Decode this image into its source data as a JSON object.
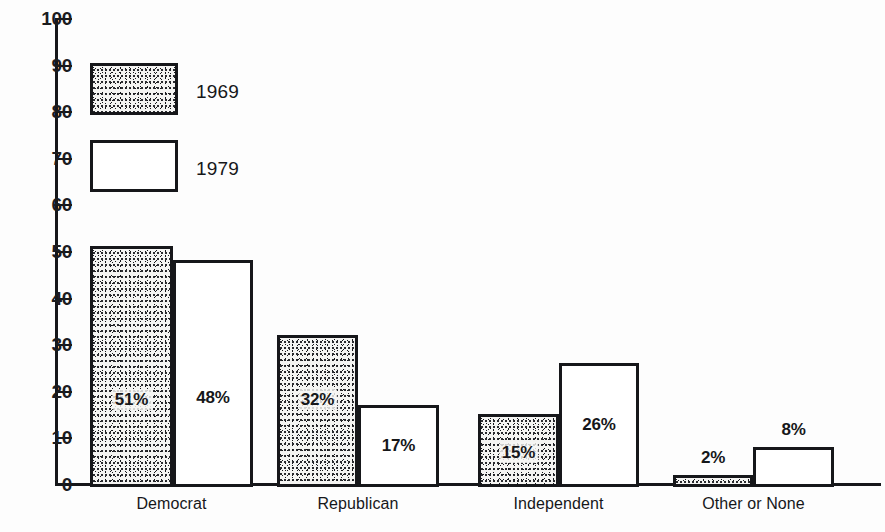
{
  "chart_data": {
    "type": "bar",
    "title": "",
    "subtitle": "",
    "xlabel": "",
    "ylabel": "",
    "ylim": [
      0,
      100
    ],
    "grid": false,
    "legend_position": "top-left-inside",
    "categories": [
      "Democrat",
      "Republican",
      "Independent",
      "Other or None"
    ],
    "series": [
      {
        "name": "1969",
        "style": "stippled",
        "values": [
          51,
          32,
          15,
          2
        ],
        "value_labels": [
          "51%",
          "32%",
          "15%",
          "2%"
        ]
      },
      {
        "name": "1979",
        "style": "white",
        "values": [
          48,
          17,
          26,
          8
        ],
        "value_labels": [
          "48%",
          "17%",
          "26%",
          "8%"
        ]
      }
    ],
    "y_ticks": [
      0,
      10,
      20,
      30,
      40,
      50,
      60,
      70,
      80,
      90,
      100
    ],
    "y_tick_labels": [
      "0",
      "10",
      "20",
      "30",
      "40",
      "50",
      "60",
      "70",
      "80",
      "90",
      "100"
    ]
  },
  "legend": {
    "items": [
      {
        "label": "1969",
        "style": "stippled"
      },
      {
        "label": "1979",
        "style": "white"
      }
    ]
  },
  "colors": {
    "ink": "#16171a",
    "paper": "#fdfdfd",
    "stipple_fill": "#f4f4f2"
  }
}
